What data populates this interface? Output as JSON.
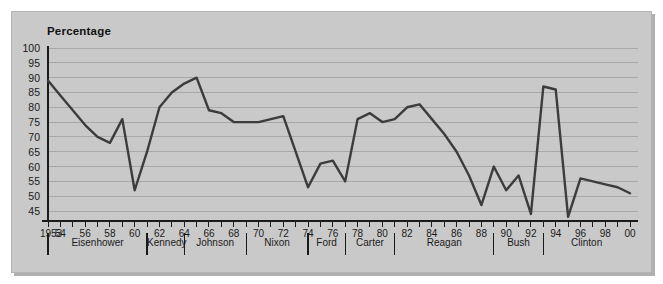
{
  "chart_data": {
    "type": "line",
    "title": "Percentage",
    "xlabel": "",
    "ylabel": "Percentage",
    "ylim": [
      45,
      100
    ],
    "ytick_step": 5,
    "yticks": [
      100,
      95,
      90,
      85,
      80,
      75,
      70,
      65,
      60,
      55,
      50,
      45
    ],
    "grid": true,
    "legend": "none",
    "line_color": "#3c3c3c",
    "background_color": "#c9c9c9",
    "gridline_color": "#a8a8a8",
    "axis_color": "#1a1a1a",
    "x_first_label": "1953",
    "x_tick_labels": [
      "1953",
      "54",
      "56",
      "58",
      "60",
      "62",
      "64",
      "66",
      "68",
      "70",
      "72",
      "74",
      "76",
      "78",
      "80",
      "82",
      "84",
      "86",
      "88",
      "90",
      "92",
      "94",
      "96",
      "98",
      "00"
    ],
    "x": [
      1953,
      1954,
      1955,
      1956,
      1957,
      1958,
      1959,
      1960,
      1961,
      1962,
      1963,
      1964,
      1965,
      1966,
      1967,
      1968,
      1969,
      1970,
      1971,
      1972,
      1973,
      1974,
      1975,
      1976,
      1977,
      1978,
      1979,
      1980,
      1981,
      1982,
      1983,
      1984,
      1985,
      1986,
      1987,
      1988,
      1989,
      1990,
      1991,
      1992,
      1993,
      1994,
      1995,
      1996,
      1997,
      1998,
      1999,
      2000
    ],
    "values": [
      89,
      84,
      79,
      74,
      70,
      68,
      76,
      52,
      65,
      80,
      85,
      88,
      90,
      79,
      78,
      75,
      75,
      75,
      76,
      77,
      65,
      53,
      61,
      62,
      55,
      76,
      78,
      75,
      76,
      80,
      81,
      76,
      71,
      65,
      57,
      47,
      60,
      52,
      57,
      44,
      87,
      86,
      43,
      56,
      55,
      54,
      53,
      51
    ],
    "series": [
      {
        "name": "Percentage",
        "values": [
          89,
          84,
          79,
          74,
          70,
          68,
          76,
          52,
          65,
          80,
          85,
          88,
          90,
          79,
          78,
          75,
          75,
          75,
          76,
          77,
          65,
          53,
          61,
          62,
          55,
          76,
          78,
          75,
          76,
          80,
          81,
          76,
          71,
          65,
          57,
          47,
          60,
          52,
          57,
          44,
          87,
          86,
          43,
          56,
          55,
          54,
          53,
          51
        ]
      }
    ],
    "presidents": [
      {
        "name": "Eisenhower",
        "start": 1953,
        "end": 1961
      },
      {
        "name": "Kennedy",
        "start": 1961,
        "end": 1964
      },
      {
        "name": "Johnson",
        "start": 1964,
        "end": 1969
      },
      {
        "name": "Nixon",
        "start": 1969,
        "end": 1974
      },
      {
        "name": "Ford",
        "start": 1974,
        "end": 1977
      },
      {
        "name": "Carter",
        "start": 1977,
        "end": 1981
      },
      {
        "name": "Reagan",
        "start": 1981,
        "end": 1989
      },
      {
        "name": "Bush",
        "start": 1989,
        "end": 1993
      },
      {
        "name": "Clinton",
        "start": 1993,
        "end": 2001
      }
    ]
  }
}
